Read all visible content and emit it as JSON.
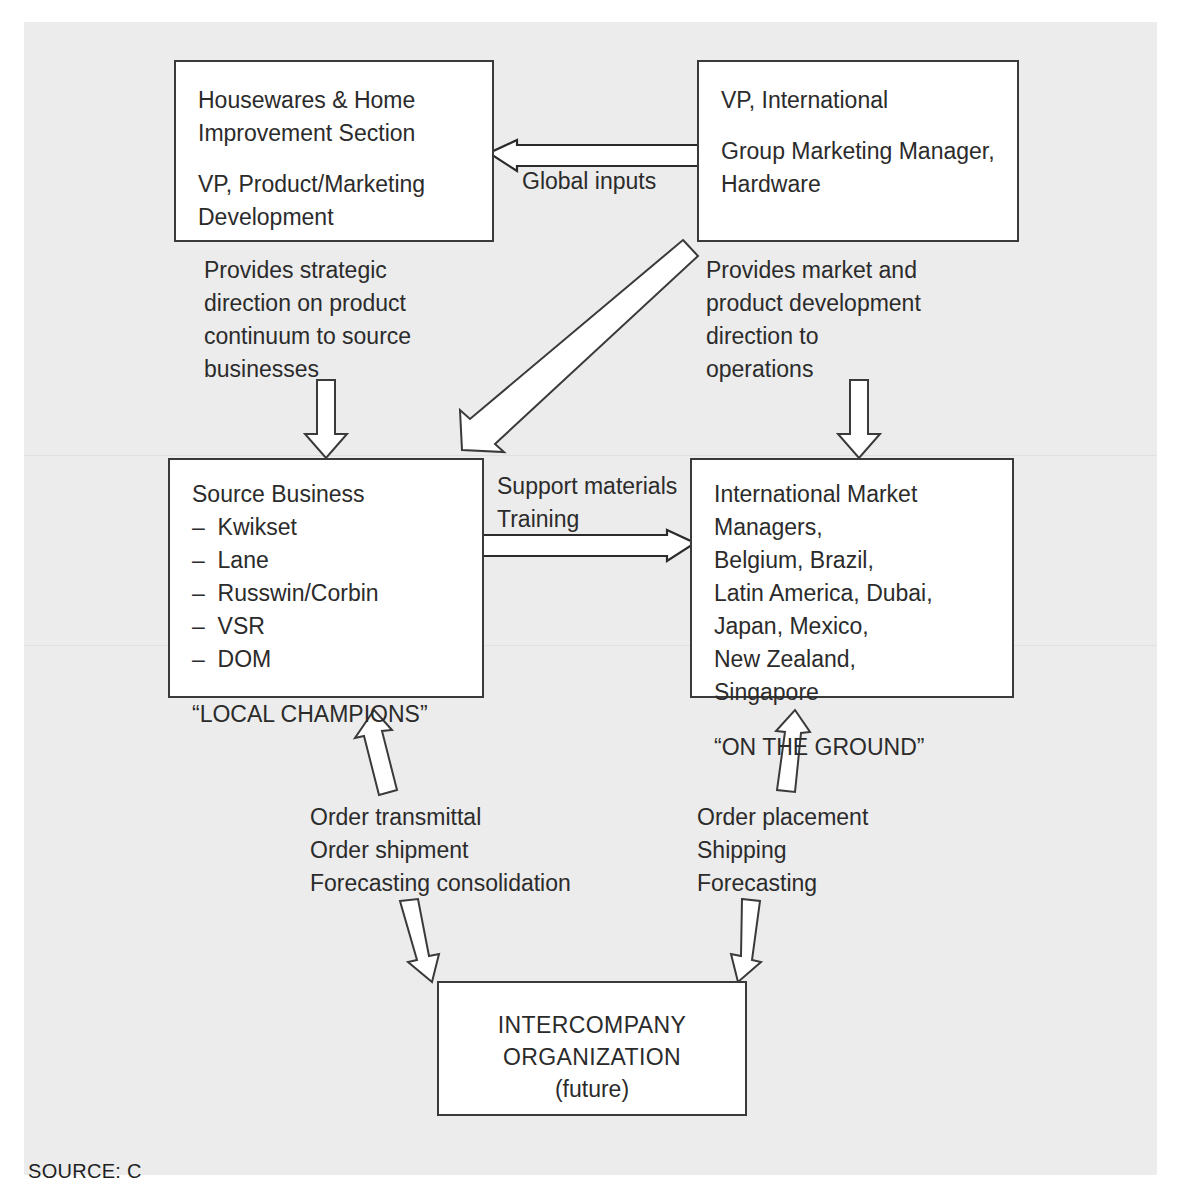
{
  "diagram": {
    "boxes": {
      "housewares": {
        "line1": "Housewares & Home",
        "line2": "Improvement Section",
        "line3": "VP, Product/Marketing",
        "line4": "Development"
      },
      "vp_international": {
        "line1": "VP, International",
        "line2": "Group Marketing Manager,",
        "line3": "Hardware"
      },
      "source_business": {
        "heading": "Source Business",
        "items": [
          "–  Kwikset",
          "–  Lane",
          "–  Russwin/Corbin",
          "–  VSR",
          "–  DOM"
        ],
        "tagline": "“LOCAL CHAMPIONS”"
      },
      "international_market_managers": {
        "lines": [
          "International Market Managers,",
          "Belgium, Brazil,",
          "Latin America, Dubai,",
          "Japan, Mexico,",
          "New Zealand,",
          "Singapore"
        ],
        "tagline": "“ON THE GROUND”"
      },
      "intercompany": {
        "line1": "INTERCOMPANY",
        "line2": "ORGANIZATION",
        "line3": "(future)"
      }
    },
    "labels": {
      "global_inputs": "Global inputs",
      "strategic_direction": "Provides strategic\ndirection on product\ncontinuum to source\nbusinesses",
      "market_direction": "Provides market and\nproduct development\ndirection to\noperations",
      "support_training": "Support materials\nTraining",
      "order_left": "Order transmittal\nOrder shipment\nForecasting consolidation",
      "order_right": "Order placement\nShipping\nForecasting"
    },
    "caption": "SOURCE:  C",
    "colors": {
      "ink": "#2b2b2b",
      "stroke": "#3a3a3a",
      "page": "#ececec",
      "box_fill": "#ffffff"
    }
  }
}
